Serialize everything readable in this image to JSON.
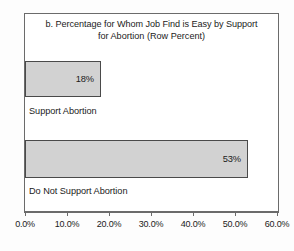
{
  "chart_data": {
    "type": "bar",
    "orientation": "horizontal",
    "title": "b. Percentage for Whom Job Find is Easy by Support for Abortion (Row Percent)",
    "title_lines": [
      "b. Percentage for Whom Job Find is Easy by Support",
      "for Abortion (Row Percent)"
    ],
    "categories": [
      "Support Abortion",
      "Do Not Support Abortion"
    ],
    "values": [
      18,
      53
    ],
    "value_labels": [
      "18%",
      "53%"
    ],
    "xlabel": "",
    "ylabel": "",
    "xlim": [
      0,
      60
    ],
    "xtick_values": [
      0,
      10,
      20,
      30,
      40,
      50,
      60
    ],
    "xtick_labels": [
      "0.0%",
      "10.0%",
      "20.0%",
      "30.0%",
      "40.0%",
      "50.0%",
      "60.0%"
    ],
    "grid": false,
    "legend": false,
    "bar_fill_color": "#d2d2d2",
    "bar_border_color": "#4a4a4a",
    "axis_color": "#6b6b6b",
    "text_color": "#1b1b1b"
  }
}
